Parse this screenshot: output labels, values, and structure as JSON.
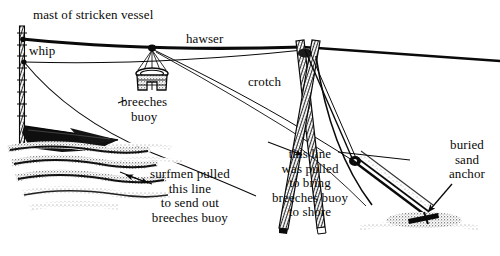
{
  "figure": {
    "kind": "line-drawing",
    "background_color": "#ffffff",
    "ink_color": "#0a0a0a"
  },
  "labels": {
    "mast": "mast of stricken vessel",
    "whip": "whip",
    "hawser": "hawser",
    "breeches_buoy": "breeches\nbuoy",
    "crotch": "crotch",
    "surfmen_note": "surfmen pulled\nthis line\nto send out\nbreeches buoy",
    "shore_note": "this line\nwas pulled\nto bring\nbreeches buoy\nto shore",
    "sand_anchor": "buried\nsand\nanchor"
  },
  "parts": {
    "mast": "mast",
    "hawser": "hawser",
    "whip_line": "whip-line",
    "breeches_buoy": "breeches-buoy",
    "crotch": "crotch",
    "sand_anchor": "sand-anchor",
    "hull": "stricken-vessel-hull",
    "waves": "waves",
    "beach": "beach"
  }
}
